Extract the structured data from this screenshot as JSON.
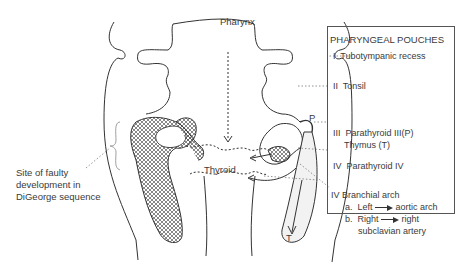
{
  "diagram": {
    "labels": {
      "pharynx": "Pharynx",
      "thyroid": "Thyroid",
      "p_marker": "P",
      "t_marker": "T",
      "digeorge_line1": "Site of faulty",
      "digeorge_line2": "development in",
      "digeorge_line3": "DiGeorge sequence"
    },
    "legend": {
      "title": "PHARYNGEAL POUCHES",
      "items": [
        {
          "numeral": "I",
          "text": "Tubotympanic recess"
        },
        {
          "numeral": "II",
          "text": "Tonsil"
        },
        {
          "numeral": "III",
          "text": "Parathyroid III(P)",
          "text2": "Thymus (T)"
        },
        {
          "numeral": "IV",
          "text": "Parathyroid IV"
        }
      ]
    },
    "arch": {
      "title": "IV  Branchial arch",
      "a_prefix": "a.",
      "a_from": "Left",
      "a_to": "aortic arch",
      "b_prefix": "b.",
      "b_from": "Right",
      "b_to": "right",
      "b_to2": "subclavian artery"
    },
    "colors": {
      "line": "#333333",
      "text": "#3a3a3a",
      "hatch": "#555555"
    }
  }
}
